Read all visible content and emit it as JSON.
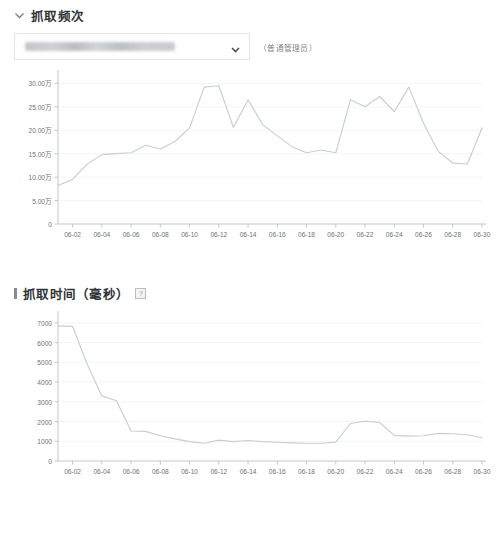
{
  "section1": {
    "icon": "chevron-down-icon",
    "title": "抓取频次",
    "selector": {
      "value": "",
      "placeholder": "",
      "redacted": true,
      "caret_icon": "chevron-down-icon"
    },
    "role_note": "（普通管理员）"
  },
  "section2": {
    "icon": "vertical-bar-icon",
    "title": "抓取时间（毫秒）",
    "help_icon": "question-mark-icon",
    "help_glyph": "?"
  },
  "colors": {
    "line": "#c9ced3",
    "axis": "#c2c6ca",
    "grid": "#f4f5f6",
    "tick_text": "#6e7276",
    "title_text": "#2f3337",
    "border": "#e3e5e7",
    "background": "#ffffff"
  },
  "chart_data": [
    {
      "type": "line",
      "title": "抓取频次",
      "xlabel": "",
      "ylabel": "",
      "grid": true,
      "legend": "none",
      "yunit": "万",
      "ytick_labels": [
        "30.00万",
        "25.00万",
        "20.00万",
        "15.00万",
        "10.00万",
        "5.00万",
        "0"
      ],
      "ytick_values": [
        300000,
        250000,
        200000,
        150000,
        100000,
        50000,
        0
      ],
      "ylim": [
        0,
        320000
      ],
      "xtick_labels": [
        "06-02",
        "06-04",
        "06-06",
        "06-08",
        "06-10",
        "06-12",
        "06-14",
        "06-16",
        "06-18",
        "06-20",
        "06-22",
        "06-24",
        "06-26",
        "06-28",
        "06-30"
      ],
      "x": [
        "06-01",
        "06-02",
        "06-03",
        "06-04",
        "06-05",
        "06-06",
        "06-07",
        "06-08",
        "06-09",
        "06-10",
        "06-11",
        "06-12",
        "06-13",
        "06-14",
        "06-15",
        "06-16",
        "06-17",
        "06-18",
        "06-19",
        "06-20",
        "06-21",
        "06-22",
        "06-23",
        "06-24",
        "06-25",
        "06-26",
        "06-27",
        "06-28",
        "06-29",
        "06-30"
      ],
      "values": [
        82000,
        95000,
        128000,
        148000,
        150000,
        152000,
        168000,
        160000,
        176000,
        205000,
        292000,
        295000,
        206000,
        265000,
        212000,
        188000,
        165000,
        152000,
        158000,
        152000,
        265000,
        250000,
        272000,
        240000,
        292000,
        215000,
        155000,
        130000,
        128000,
        205000
      ]
    },
    {
      "type": "line",
      "title": "抓取时间（毫秒）",
      "xlabel": "",
      "ylabel": "",
      "grid": true,
      "legend": "none",
      "ytick_labels": [
        "7000",
        "6000",
        "5000",
        "4000",
        "3000",
        "2000",
        "1000",
        "0"
      ],
      "ytick_values": [
        7000,
        6000,
        5000,
        4000,
        3000,
        2000,
        1000,
        0
      ],
      "ylim": [
        0,
        7400
      ],
      "xtick_labels": [
        "06-02",
        "06-04",
        "06-06",
        "06-08",
        "06-10",
        "06-12",
        "06-14",
        "06-16",
        "06-18",
        "06-20",
        "06-22",
        "06-24",
        "06-26",
        "06-28",
        "06-30"
      ],
      "x": [
        "06-01",
        "06-02",
        "06-03",
        "06-04",
        "06-05",
        "06-06",
        "06-07",
        "06-08",
        "06-09",
        "06-10",
        "06-11",
        "06-12",
        "06-13",
        "06-14",
        "06-15",
        "06-16",
        "06-17",
        "06-18",
        "06-19",
        "06-20",
        "06-21",
        "06-22",
        "06-23",
        "06-24",
        "06-25",
        "06-26",
        "06-27",
        "06-28",
        "06-29",
        "06-30"
      ],
      "values": [
        6850,
        6820,
        4900,
        3300,
        3050,
        1520,
        1500,
        1280,
        1120,
        980,
        900,
        1060,
        980,
        1040,
        980,
        950,
        920,
        900,
        900,
        960,
        1900,
        2020,
        1950,
        1300,
        1260,
        1280,
        1400,
        1380,
        1330,
        1180
      ]
    }
  ]
}
